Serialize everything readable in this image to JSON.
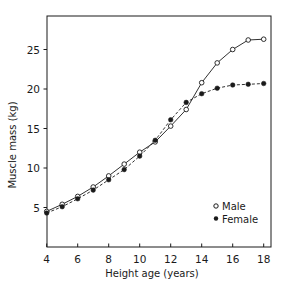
{
  "chart_data": {
    "type": "line",
    "title": "",
    "xlabel": "Height age (years)",
    "ylabel": "Muscle mass (kg)",
    "xlim": [
      4,
      18.5
    ],
    "ylim": [
      0,
      29
    ],
    "x_ticks": [
      4,
      6,
      8,
      10,
      12,
      14,
      16,
      18
    ],
    "y_ticks": [
      5,
      10,
      15,
      20,
      25
    ],
    "grid": false,
    "legend_position": "lower right",
    "x": [
      4,
      5,
      6,
      7,
      8,
      9,
      10,
      11,
      12,
      13,
      14,
      15,
      16,
      17,
      18
    ],
    "series": [
      {
        "name": "Male",
        "marker": "open-circle",
        "line_style": "solid",
        "values": [
          4.5,
          5.4,
          6.4,
          7.6,
          9.0,
          10.5,
          12.0,
          13.3,
          15.3,
          17.4,
          20.8,
          23.3,
          25.0,
          26.2,
          26.3
        ]
      },
      {
        "name": "Female",
        "marker": "filled-circle",
        "line_style": "dashed",
        "values": [
          4.3,
          5.1,
          6.1,
          7.2,
          8.5,
          9.8,
          11.5,
          13.5,
          16.1,
          18.3,
          19.4,
          20.1,
          20.5,
          20.6,
          20.7
        ]
      }
    ]
  },
  "colors": {
    "ink": "#1a1a1a",
    "background": "#ffffff"
  }
}
